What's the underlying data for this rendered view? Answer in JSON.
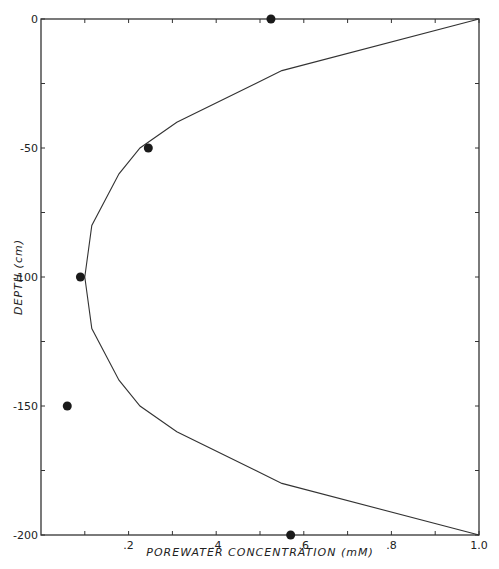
{
  "chart_data": {
    "type": "line",
    "title": "",
    "xlabel": "POREWATER CONCENTRATION (mM)",
    "ylabel": "DEPTH (cm)",
    "xlim": [
      0,
      1.0
    ],
    "ylim": [
      -200,
      0
    ],
    "grid": false,
    "legend": null,
    "x_ticks": [
      0.1,
      0.2,
      0.3,
      0.4,
      0.5,
      0.6,
      0.7,
      0.8,
      0.9,
      1.0
    ],
    "x_tick_labels": [
      {
        "value": 0.2,
        "label": ".2"
      },
      {
        "value": 0.4,
        "label": ".4"
      },
      {
        "value": 0.6,
        "label": ".6"
      },
      {
        "value": 0.8,
        "label": ".8"
      },
      {
        "value": 1.0,
        "label": "1.0"
      }
    ],
    "y_ticks": [
      0,
      -25,
      -50,
      -75,
      -100,
      -125,
      -150,
      -175,
      -200
    ],
    "y_tick_labels": [
      {
        "value": 0,
        "label": "0"
      },
      {
        "value": -50,
        "label": "-50"
      },
      {
        "value": -100,
        "label": "-100"
      },
      {
        "value": -150,
        "label": "-150"
      },
      {
        "value": -200,
        "label": "-200"
      }
    ],
    "series": [
      {
        "name": "model profile",
        "type": "line",
        "x": [
          1.0,
          0.55,
          0.31,
          0.226,
          0.178,
          0.116,
          0.1,
          0.116,
          0.178,
          0.226,
          0.31,
          0.55,
          1.0
        ],
        "y": [
          0,
          -20,
          -40,
          -50,
          -60,
          -80,
          -100,
          -120,
          -140,
          -150,
          -160,
          -180,
          -200
        ]
      },
      {
        "name": "measured",
        "type": "scatter",
        "x": [
          0.525,
          0.245,
          0.09,
          0.06,
          0.57
        ],
        "y": [
          0,
          -50,
          -100,
          -150,
          -200
        ]
      }
    ]
  },
  "labels": {
    "xlabel": "POREWATER CONCENTRATION (mM)",
    "ylabel": "DEPTH (cm)"
  }
}
